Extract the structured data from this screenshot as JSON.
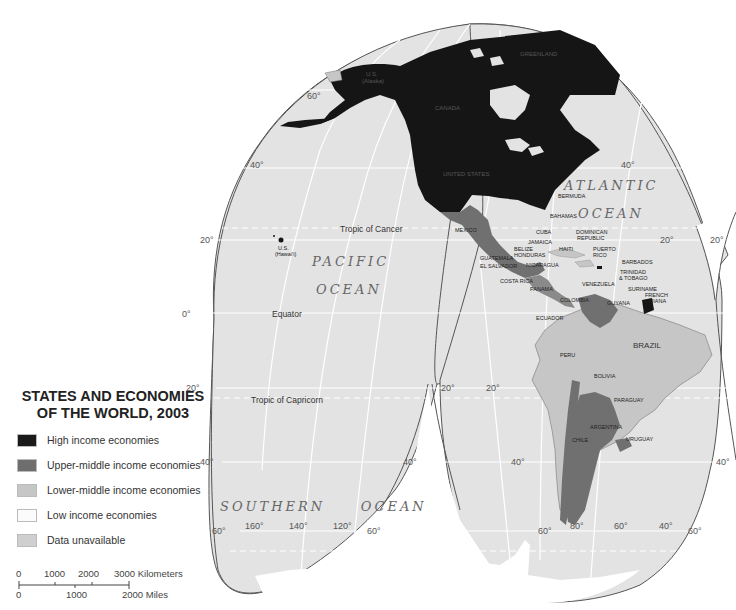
{
  "legend": {
    "title_line1": "STATES AND ECONOMIES",
    "title_line2": "OF THE WORLD, 2003",
    "items": [
      {
        "label": "High income economies",
        "color": "#1a1a1a"
      },
      {
        "label": "Upper-middle income economies",
        "color": "#6e6e6e"
      },
      {
        "label": "Lower-middle income economies",
        "color": "#c6c6c6"
      },
      {
        "label": "Low income economies",
        "color": "#fbfbfb"
      },
      {
        "label": "Data unavailable",
        "color": "#cfcfcf"
      }
    ]
  },
  "scale_bar": {
    "km_labels": [
      "0",
      "1000",
      "2000",
      "3000 Kilometers"
    ],
    "mile_labels": [
      "0",
      "1000",
      "2000 Miles"
    ]
  },
  "oceans": {
    "pacific_line1": "PACIFIC",
    "pacific_line2": "OCEAN",
    "atlantic_line1": "ATLANTIC",
    "atlantic_line2": "OCEAN",
    "southern": "SOUTHERN     OCEAN"
  },
  "reference_lines": {
    "tropic_cancer": "Tropic of Cancer",
    "equator": "Equator",
    "tropic_capricorn": "Tropic of Capricorn"
  },
  "degree_labels": {
    "lat_60n_left": "60°",
    "lat_40n_left": "40°",
    "lat_20n_left": "20°",
    "lat_0_left": "0°",
    "lat_20s_left": "20°",
    "lat_40s_left": "40°",
    "lat_60s_left": "60°",
    "lat_40n_mid": "40°",
    "lat_20n_mid": "20°",
    "lat_20n_right": "20°",
    "lat_20s_gap_left": "20°",
    "lat_20s_gap_right": "20°",
    "lat_40s_gap_left": "40°",
    "lat_40s_gap_right": "40°",
    "lat_60s_gap_left": "60°",
    "lat_60s_gap_right": "60°",
    "lat_60s_sa_right": "60°",
    "lat_40s_far_right": "40°",
    "lon_160": "160°",
    "lon_140": "140°",
    "lon_120": "120°",
    "lon_80": "80°",
    "lon_60": "60°",
    "lon_40": "40°"
  },
  "countries": {
    "greenland": "GREENLAND",
    "us_alaska_1": "U.S.",
    "us_alaska_2": "(Alaska)",
    "canada": "CANADA",
    "united_states": "UNITED STATES",
    "us_hawaii_1": "U.S.",
    "us_hawaii_2": "(Hawai'i)",
    "mexico": "MEXICO",
    "bermuda": "BERMUDA",
    "bahamas": "BAHAMAS",
    "cuba": "CUBA",
    "jamaica": "JAMAICA",
    "haiti": "HAITI",
    "dominican_republic_1": "DOMINICAN",
    "dominican_republic_2": "REPUBLIC",
    "puerto_rico_1": "PUERTO",
    "puerto_rico_2": "RICO",
    "barbados": "BARBADOS",
    "trinidad_1": "TRINIDAD",
    "trinidad_2": "& TOBAGO",
    "guatemala": "GUATEMALA",
    "belize": "BELIZE",
    "honduras": "HONDURAS",
    "el_salvador": "EL SALVADOR",
    "nicaragua": "NICARAGUA",
    "costa_rica": "COSTA RICA",
    "panama": "PANAMA",
    "venezuela": "VENEZUELA",
    "colombia": "COLOMBIA",
    "guyana": "GUYANA",
    "suriname": "SURINAME",
    "french_guiana_1": "FRENCH",
    "french_guiana_2": "GUIANA",
    "ecuador": "ECUADOR",
    "peru": "PERU",
    "brazil": "BRAZIL",
    "bolivia": "BOLIVIA",
    "paraguay": "PARAGUAY",
    "argentina": "ARGENTINA",
    "chile": "CHILE",
    "uruguay": "URUGUAY"
  }
}
